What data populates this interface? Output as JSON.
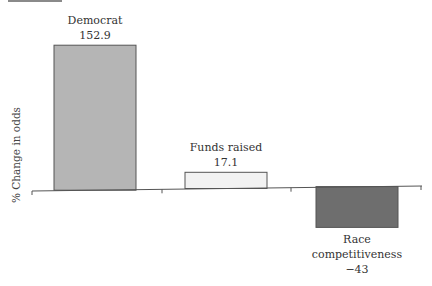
{
  "chart_data": {
    "type": "bar",
    "title": "",
    "xlabel": "",
    "ylabel": "% Change in odds",
    "categories": [
      "Democrat",
      "Funds raised",
      "Race competitiveness"
    ],
    "values": [
      152.9,
      17.1,
      -43
    ],
    "value_labels": [
      "152.9",
      "17.1",
      "−43"
    ],
    "colors": [
      "#b5b5b5",
      "#f2f2f2",
      "#6e6e6e"
    ],
    "ylim": [
      -45,
      160
    ],
    "grid": false,
    "legend": "none",
    "label_lines": [
      [
        "Democrat"
      ],
      [
        "Funds raised"
      ],
      [
        "Race",
        "competitiveness"
      ]
    ]
  }
}
